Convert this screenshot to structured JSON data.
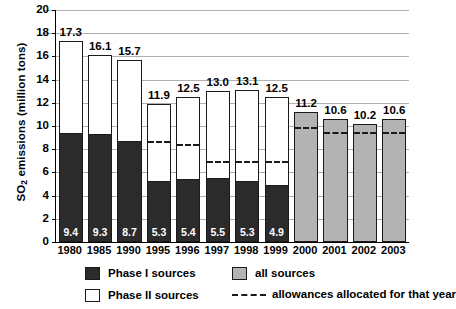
{
  "chart_data": {
    "type": "bar",
    "title": "",
    "xlabel": "",
    "ylabel": "SO2 emissions (million tons)",
    "ylabel_prefix": "SO",
    "ylabel_sub": "2",
    "ylabel_suffix": " emissions (million tons)",
    "ylim": [
      0,
      20
    ],
    "ytick_values": [
      0,
      2,
      4,
      6,
      8,
      10,
      12,
      14,
      16,
      18,
      20
    ],
    "ytick_labels": [
      "0",
      "2",
      "4",
      "6",
      "8",
      "10",
      "12",
      "14",
      "16",
      "18",
      "20"
    ],
    "grid": true,
    "grid_axis": "y",
    "stacked": true,
    "categories": [
      "1980",
      "1985",
      "1990",
      "1995",
      "1996",
      "1997",
      "1998",
      "1999",
      "2000",
      "2001",
      "2002",
      "2003"
    ],
    "series": [
      {
        "name": "Phase I sources",
        "color": "#2b2b2b",
        "values": [
          9.4,
          9.3,
          8.7,
          5.3,
          5.4,
          5.5,
          5.3,
          4.9,
          null,
          null,
          null,
          null
        ],
        "labels": [
          "9.4",
          "9.3",
          "8.7",
          "5.3",
          "5.4",
          "5.5",
          "5.3",
          "4.9",
          "",
          "",
          "",
          ""
        ]
      },
      {
        "name": "Phase II sources",
        "color": "#ffffff",
        "values": [
          7.9,
          6.8,
          7.0,
          6.6,
          7.1,
          7.5,
          7.8,
          7.6,
          null,
          null,
          null,
          null
        ]
      },
      {
        "name": "all sources",
        "color": "#b3b3b3",
        "values": [
          null,
          null,
          null,
          null,
          null,
          null,
          null,
          null,
          11.2,
          10.6,
          10.2,
          10.6
        ]
      }
    ],
    "totals": [
      17.3,
      16.1,
      15.7,
      11.9,
      12.5,
      13.0,
      13.1,
      12.5,
      11.2,
      10.6,
      10.2,
      10.6
    ],
    "total_labels": [
      "17.3",
      "16.1",
      "15.7",
      "11.9",
      "12.5",
      "13.0",
      "13.1",
      "12.5",
      "11.2",
      "10.6",
      "10.2",
      "10.6"
    ],
    "allowances": {
      "name": "allowances allocated for that year",
      "values": [
        null,
        null,
        null,
        8.7,
        8.45,
        7.0,
        7.0,
        6.95,
        9.95,
        9.5,
        9.5,
        9.5
      ]
    },
    "legend": [
      {
        "key": "phase-i",
        "label": "Phase I sources",
        "swatch": "dark"
      },
      {
        "key": "all-sources",
        "label": "all sources",
        "swatch": "gray"
      },
      {
        "key": "phase-ii",
        "label": "Phase II sources",
        "swatch": "white"
      },
      {
        "key": "allowances",
        "label": "allowances allocated for that year",
        "swatch": "dashed-line"
      }
    ]
  }
}
